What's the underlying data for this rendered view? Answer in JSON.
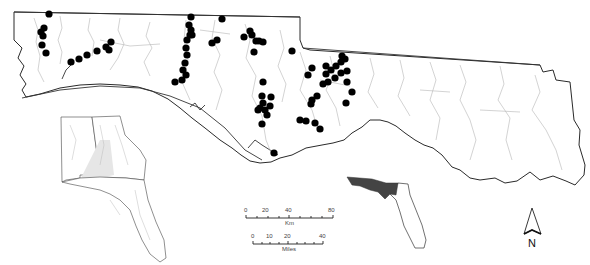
{
  "figure": {
    "type": "map",
    "region": "Florida panhandle and adjacent Alabama/Georgia river basins",
    "colors": {
      "background": "#ffffff",
      "site_marker": "#000000",
      "rivers": "#b5b5b5",
      "coastline": "#2a2a2a",
      "study_area_highlight": "#444444"
    }
  },
  "scale_bars": {
    "km": {
      "ticks": [
        "0",
        "20",
        "40",
        "80"
      ],
      "unit": "Km"
    },
    "miles": {
      "ticks": [
        "0",
        "10",
        "20",
        "40"
      ],
      "unit": "Miles"
    }
  },
  "north_arrow": {
    "label": "N"
  },
  "insets": {
    "southeast_us": {
      "description": "Alabama, Georgia, Florida with basin shading"
    },
    "florida_locator": {
      "description": "Florida outline with study area shaded dark"
    }
  },
  "sites": [
    [
      49,
      14
    ],
    [
      44,
      28
    ],
    [
      41,
      32
    ],
    [
      43,
      36
    ],
    [
      42,
      45
    ],
    [
      46,
      53
    ],
    [
      71,
      62
    ],
    [
      79,
      59
    ],
    [
      87,
      55
    ],
    [
      97,
      51
    ],
    [
      106,
      47
    ],
    [
      111,
      42
    ],
    [
      109,
      50
    ],
    [
      175,
      82
    ],
    [
      182,
      80
    ],
    [
      186,
      75
    ],
    [
      183,
      70
    ],
    [
      185,
      63
    ],
    [
      187,
      55
    ],
    [
      186,
      48
    ],
    [
      187,
      40
    ],
    [
      190,
      35
    ],
    [
      191,
      30
    ],
    [
      189,
      25
    ],
    [
      191,
      17
    ],
    [
      192,
      35
    ],
    [
      222,
      19
    ],
    [
      212,
      43
    ],
    [
      217,
      40
    ],
    [
      244,
      37
    ],
    [
      250,
      31
    ],
    [
      252,
      35
    ],
    [
      256,
      41
    ],
    [
      263,
      42
    ],
    [
      254,
      52
    ],
    [
      259,
      41
    ],
    [
      292,
      51
    ],
    [
      263,
      82
    ],
    [
      262,
      96
    ],
    [
      263,
      103
    ],
    [
      260,
      108
    ],
    [
      265,
      110
    ],
    [
      270,
      106
    ],
    [
      271,
      97
    ],
    [
      267,
      115
    ],
    [
      262,
      124
    ],
    [
      258,
      110
    ],
    [
      274,
      153
    ],
    [
      317,
      96
    ],
    [
      311,
      104
    ],
    [
      300,
      120
    ],
    [
      306,
      121
    ],
    [
      312,
      100
    ],
    [
      326,
      74
    ],
    [
      331,
      70
    ],
    [
      336,
      66
    ],
    [
      341,
      62
    ],
    [
      345,
      59
    ],
    [
      323,
      84
    ],
    [
      328,
      82
    ],
    [
      335,
      78
    ],
    [
      341,
      73
    ],
    [
      347,
      71
    ],
    [
      326,
      66
    ],
    [
      342,
      56
    ],
    [
      347,
      82
    ],
    [
      352,
      92
    ],
    [
      346,
      103
    ],
    [
      315,
      123
    ],
    [
      320,
      129
    ],
    [
      312,
      68
    ],
    [
      308,
      75
    ]
  ]
}
